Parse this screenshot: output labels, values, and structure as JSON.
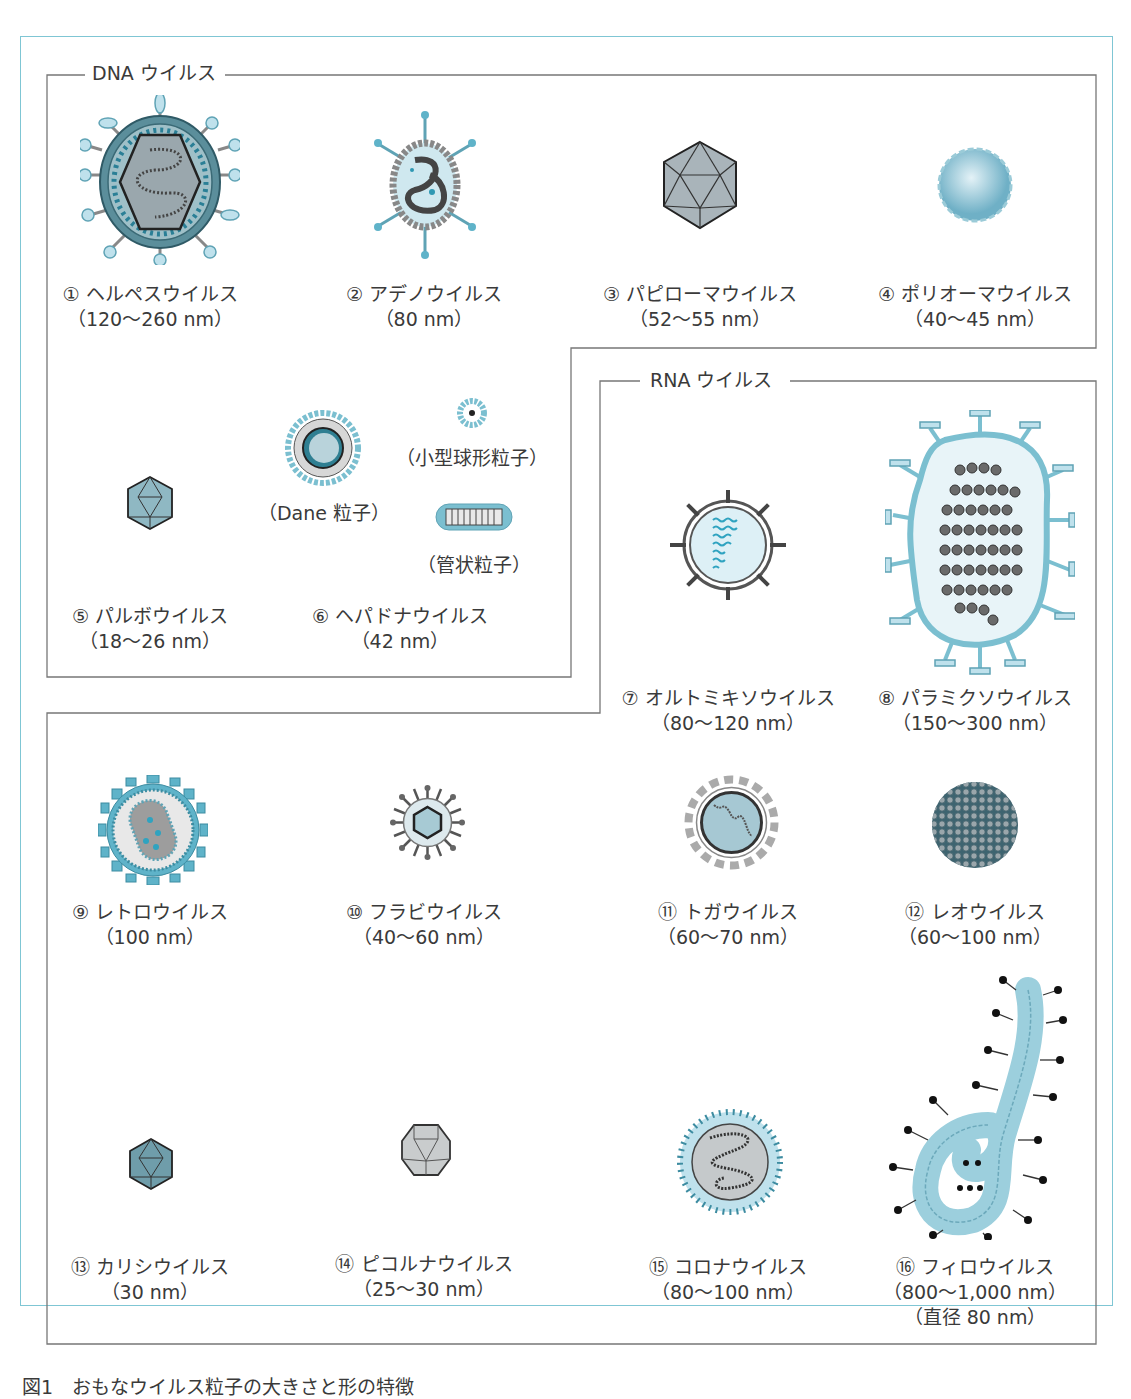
{
  "figure": {
    "frame_color": "#7fc6d4",
    "accent_blue": "#5fb3c9",
    "light_blue": "#c8e6ef",
    "dark_gray": "#4a4a4a",
    "sections": {
      "dna": {
        "title": "DNA ウイルス"
      },
      "rna": {
        "title": "RNA ウイルス"
      }
    },
    "viruses": [
      {
        "num": "①",
        "name": "ヘルペスウイルス",
        "size": "（120〜260 nm）",
        "group": "DNA"
      },
      {
        "num": "②",
        "name": "アデノウイルス",
        "size": "（80 nm）",
        "group": "DNA"
      },
      {
        "num": "③",
        "name": "パピローマウイルス",
        "size": "（52〜55 nm）",
        "group": "DNA"
      },
      {
        "num": "④",
        "name": "ポリオーマウイルス",
        "size": "（40〜45 nm）",
        "group": "DNA"
      },
      {
        "num": "⑤",
        "name": "パルボウイルス",
        "size": "（18〜26 nm）",
        "group": "DNA"
      },
      {
        "num": "⑥",
        "name": "ヘパドナウイルス",
        "size": "（42 nm）",
        "group": "DNA"
      },
      {
        "num": "⑦",
        "name": "オルトミキソウイルス",
        "size": "（80〜120 nm）",
        "group": "RNA"
      },
      {
        "num": "⑧",
        "name": "パラミクソウイルス",
        "size": "（150〜300 nm）",
        "group": "RNA"
      },
      {
        "num": "⑨",
        "name": "レトロウイルス",
        "size": "（100 nm）",
        "group": "RNA"
      },
      {
        "num": "⑩",
        "name": "フラビウイルス",
        "size": "（40〜60 nm）",
        "group": "RNA"
      },
      {
        "num": "⑪",
        "name": "トガウイルス",
        "size": "（60〜70 nm）",
        "group": "RNA"
      },
      {
        "num": "⑫",
        "name": "レオウイルス",
        "size": "（60〜100 nm）",
        "group": "RNA"
      },
      {
        "num": "⑬",
        "name": "カリシウイルス",
        "size": "（30 nm）",
        "group": "RNA"
      },
      {
        "num": "⑭",
        "name": "ピコルナウイルス",
        "size": "（25〜30 nm）",
        "group": "RNA"
      },
      {
        "num": "⑮",
        "name": "コロナウイルス",
        "size": "（80〜100 nm）",
        "group": "RNA"
      },
      {
        "num": "⑯",
        "name": "フィロウイルス",
        "size": "（800〜1,000 nm）",
        "size2": "（直径 80 nm）",
        "group": "RNA"
      }
    ],
    "hepadna_particles": {
      "dane": "（Dane 粒子）",
      "small_spherical": "（小型球形粒子）",
      "tubular": "（管状粒子）"
    },
    "caption": "図1　おもなウイルス粒子の大きさと形の特徴"
  }
}
